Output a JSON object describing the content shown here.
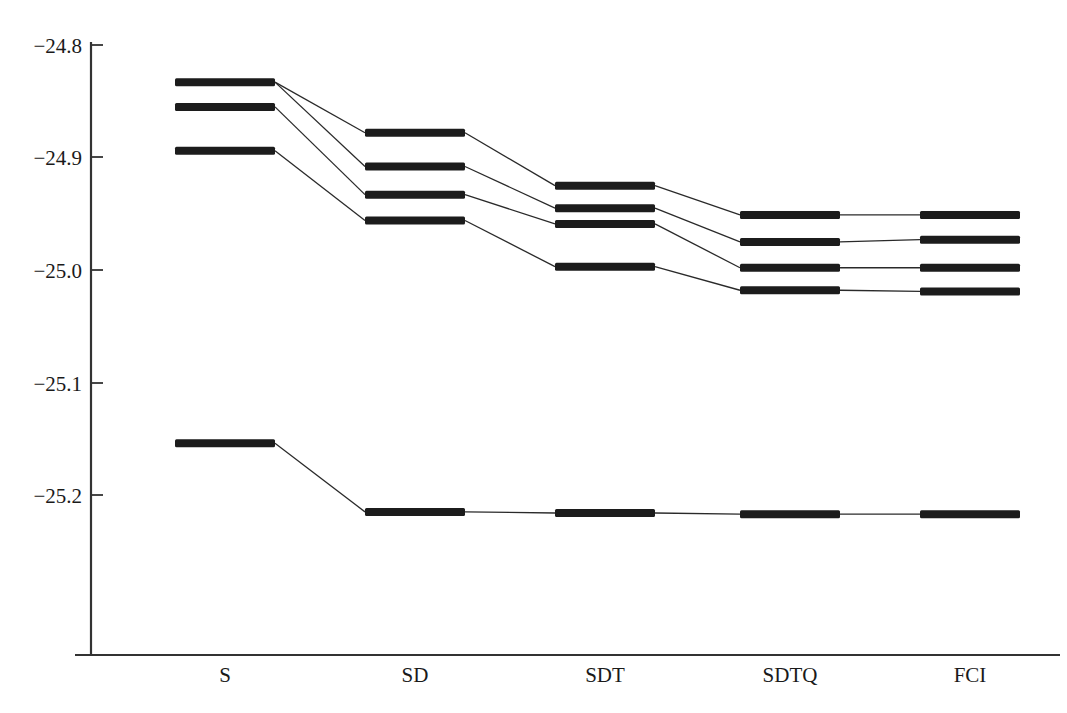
{
  "chart_data": {
    "type": "line",
    "title": "",
    "subtitle": "",
    "xlabel": "",
    "ylabel": "",
    "categories": [
      "S",
      "SD",
      "SDT",
      "SDTQ",
      "FCI"
    ],
    "ylim": [
      -25.26,
      -24.78
    ],
    "yticks": [
      -24.8,
      -24.9,
      -25.0,
      -25.1,
      -25.2
    ],
    "ytick_labels": [
      "−24.8",
      "−24.9",
      "−25.0",
      "−25.1",
      "−25.2"
    ],
    "grid": false,
    "legend": false,
    "series": [
      {
        "name": "ground-state",
        "values": [
          -25.154,
          -25.215,
          -25.216,
          -25.217,
          -25.217
        ]
      },
      {
        "name": "excited-state-1",
        "values": [
          -24.833,
          -24.878,
          -24.925,
          -24.951,
          -24.951
        ]
      },
      {
        "name": "excited-state-2",
        "values": [
          -24.833,
          -24.908,
          -24.945,
          -24.975,
          -24.973
        ]
      },
      {
        "name": "excited-state-3",
        "values": [
          -24.855,
          -24.933,
          -24.959,
          -24.998,
          -24.998
        ]
      },
      {
        "name": "excited-state-4",
        "values": [
          -24.894,
          -24.956,
          -24.997,
          -25.018,
          -25.019
        ]
      }
    ],
    "colors": {
      "level_marker": "#1c1c1c",
      "connector": "#2a2a2a",
      "axis": "#333333",
      "background": "#ffffff"
    }
  },
  "axes": {
    "y_axis_name": "energy-axis",
    "x_axis_name": "method-axis"
  }
}
